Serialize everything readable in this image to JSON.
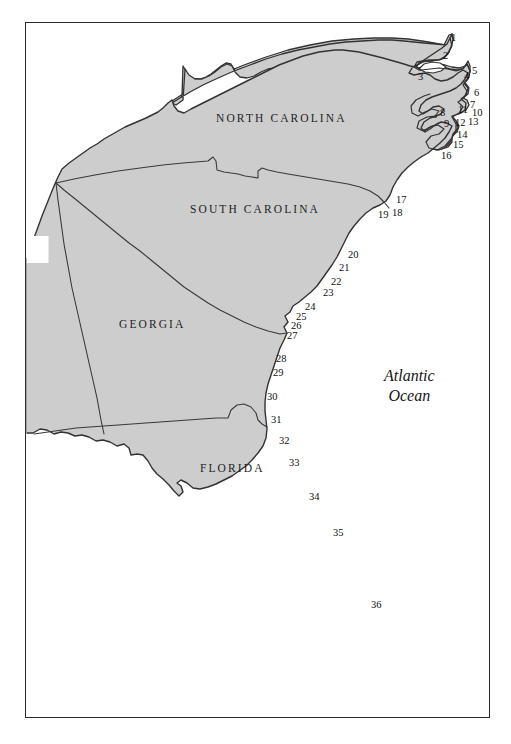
{
  "figure": {
    "kind": "reference-map",
    "frame": {
      "x": 25,
      "y": 22,
      "width": 465,
      "height": 696
    },
    "colors": {
      "land_fill": "#cdcdcd",
      "land_outline": "#333333",
      "state_border": "#3a3a3a",
      "water_fill": "#ffffff",
      "frame_border": "#2a2a2a",
      "text": "#111111"
    }
  },
  "state_labels": [
    {
      "name": "north-carolina",
      "text": "NORTH CAROLINA",
      "x": 216,
      "y": 112
    },
    {
      "name": "south-carolina",
      "text": "SOUTH CAROLINA",
      "x": 190,
      "y": 203
    },
    {
      "name": "georgia",
      "text": "GEORGIA",
      "x": 119,
      "y": 318
    },
    {
      "name": "florida",
      "text": "FLORIDA",
      "x": 200,
      "y": 462
    }
  ],
  "ocean_labels": [
    {
      "name": "atlantic-ocean",
      "line1": "Atlantic",
      "line2": "Ocean",
      "x": 384,
      "y": 366
    }
  ],
  "site_numbers": [
    {
      "id": 1,
      "label": "1",
      "x": 451,
      "y": 33
    },
    {
      "id": 2,
      "label": "2",
      "x": 443,
      "y": 51
    },
    {
      "id": 3,
      "label": "3",
      "x": 418,
      "y": 72
    },
    {
      "id": 4,
      "label": "4",
      "x": 464,
      "y": 71
    },
    {
      "id": 5,
      "label": "5",
      "x": 472,
      "y": 66
    },
    {
      "id": 6,
      "label": "6",
      "x": 474,
      "y": 88
    },
    {
      "id": 7,
      "label": "7",
      "x": 470,
      "y": 100
    },
    {
      "id": 8,
      "label": "8",
      "x": 440,
      "y": 108
    },
    {
      "id": 9,
      "label": "9",
      "x": 444,
      "y": 119
    },
    {
      "id": 10,
      "label": "10",
      "x": 472,
      "y": 108
    },
    {
      "id": 11,
      "label": "11",
      "x": 458,
      "y": 105
    },
    {
      "id": 12,
      "label": "12",
      "x": 455,
      "y": 118
    },
    {
      "id": 13,
      "label": "13",
      "x": 468,
      "y": 117
    },
    {
      "id": 14,
      "label": "14",
      "x": 457,
      "y": 130
    },
    {
      "id": 15,
      "label": "15",
      "x": 453,
      "y": 140
    },
    {
      "id": 16,
      "label": "16",
      "x": 441,
      "y": 151
    },
    {
      "id": 17,
      "label": "17",
      "x": 396,
      "y": 195
    },
    {
      "id": 18,
      "label": "18",
      "x": 392,
      "y": 208
    },
    {
      "id": 19,
      "label": "19",
      "x": 378,
      "y": 210
    },
    {
      "id": 20,
      "label": "20",
      "x": 348,
      "y": 250
    },
    {
      "id": 21,
      "label": "21",
      "x": 339,
      "y": 263
    },
    {
      "id": 22,
      "label": "22",
      "x": 331,
      "y": 277
    },
    {
      "id": 23,
      "label": "23",
      "x": 323,
      "y": 288
    },
    {
      "id": 24,
      "label": "24",
      "x": 305,
      "y": 302
    },
    {
      "id": 25,
      "label": "25",
      "x": 296,
      "y": 312
    },
    {
      "id": 26,
      "label": "26",
      "x": 291,
      "y": 321
    },
    {
      "id": 27,
      "label": "27",
      "x": 287,
      "y": 331
    },
    {
      "id": 28,
      "label": "28",
      "x": 276,
      "y": 354
    },
    {
      "id": 29,
      "label": "29",
      "x": 273,
      "y": 368
    },
    {
      "id": 30,
      "label": "30",
      "x": 267,
      "y": 392
    },
    {
      "id": 31,
      "label": "31",
      "x": 271,
      "y": 415
    },
    {
      "id": 32,
      "label": "32",
      "x": 279,
      "y": 436
    },
    {
      "id": 33,
      "label": "33",
      "x": 289,
      "y": 458
    },
    {
      "id": 34,
      "label": "34",
      "x": 309,
      "y": 492
    },
    {
      "id": 35,
      "label": "35",
      "x": 333,
      "y": 528
    },
    {
      "id": 36,
      "label": "36",
      "x": 371,
      "y": 600
    }
  ],
  "geometry": {
    "landmass_path": "M 25,262 L 25,434 L 36,437 L 45,431 L 52,436 L 64,432 L 76,437 L 88,436 L 99,442 L 108,440 L 117,447 L 126,443 L 132,451 L 140,450 L 147,457 L 152,468 L 160,474 L 167,481 L 173,490 L 179,497 L 183,490 L 180,484 L 186,483 L 193,490 L 201,491 L 213,486 L 224,479 L 235,474 L 243,466 L 251,459 L 259,452 L 266,443 L 268,432 L 266,422 L 265,410 L 266,398 L 268,386 L 272,374 L 275,362 L 279,350 L 284,339 L 288,330 L 285,322 L 290,317 L 287,311 L 294,306 L 299,299 L 308,293 L 316,285 L 323,276 L 330,266 L 337,256 L 343,246 L 348,236 L 354,226 L 361,216 L 370,209 L 380,205 L 389,200 L 394,191 L 399,181 L 405,172 L 412,164 L 419,157 L 428,152 L 436,147 L 443,140 L 448,133 L 452,126 L 447,123 L 440,120 L 434,124 L 428,130 L 423,124 L 427,118 L 433,113 L 437,106 L 433,101 L 429,107 L 424,112 L 420,105 L 425,99 L 431,94 L 437,92 L 444,90 L 451,88 L 458,85 L 463,79 L 468,72 L 462,68 L 456,73 L 450,78 L 443,80 L 436,76 L 430,72 L 424,73 L 418,75 L 412,72 L 417,67 L 424,63 L 431,58 L 438,53 L 444,48 L 450,42 L 449,34 L 442,40 L 435,45 L 428,48 L 420,49 L 413,51 L 406,54 L 399,56 L 391,55 L 384,52 L 377,49 L 370,47 L 362,46 L 355,44 L 348,42 L 341,40 L 334,38 L 327,36 L 320,34 L 313,33 L 306,33 L 299,34 L 292,35 L 285,37 L 278,39 L 271,41 L 264,44 L 257,47 L 250,50 L 243,53 L 236,56 L 229,60 L 222,64 L 215,68 L 208,72 L 201,76 L 194,80 L 187,85 L 180,90 L 173,95 L 172,103 L 166,109 L 159,112 L 152,115 L 145,119 L 138,123 L 131,127 L 124,131 L 117,136 L 110,141 L 103,146 L 96,151 L 89,156 L 82,161 L 75,166 L 68,172 L 61,177 L 57,186 L 52,196 L 48,207 L 44,218 L 40,229 L 36,240 L 32,251 Z",
    "notes": "Stylized coastline of the US South Atlantic seaboard: NC, SC, GA, FL with Atlantic Ocean to the east."
  }
}
